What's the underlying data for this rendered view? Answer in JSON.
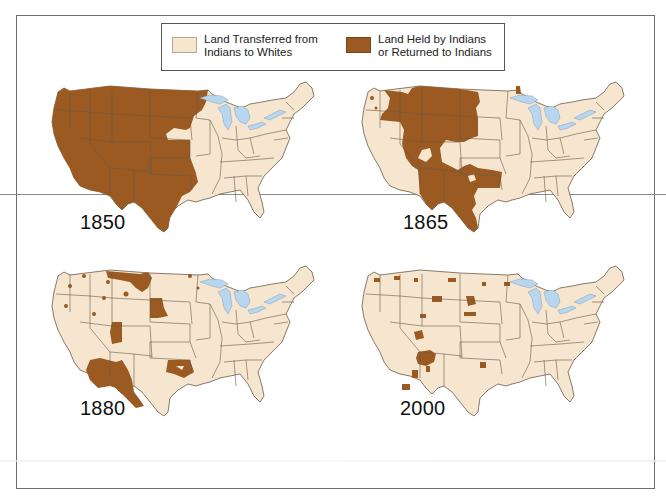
{
  "legend": {
    "items": [
      {
        "label_line1": "Land Transferred from",
        "label_line2": "Indians to Whites",
        "color": "#f6e6cf"
      },
      {
        "label_line1": "Land Held by Indians",
        "label_line2": "or Returned to Indians",
        "color": "#9a5a22"
      }
    ]
  },
  "maps": [
    {
      "year": "1850",
      "position": "top-left"
    },
    {
      "year": "1865",
      "position": "top-right"
    },
    {
      "year": "1880",
      "position": "bottom-left"
    },
    {
      "year": "2000",
      "position": "bottom-right"
    }
  ],
  "colors": {
    "transferred": "#f6e6cf",
    "held": "#9a5a22",
    "lakes": "#b8d6ee",
    "borders": "#6a5a48"
  }
}
